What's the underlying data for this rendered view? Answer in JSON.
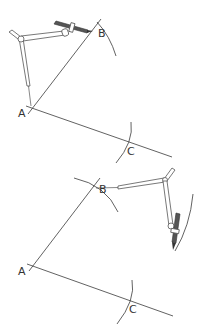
{
  "diagram": {
    "colors": {
      "line": "#3a3a3a",
      "pencil": "#555555",
      "background": "#ffffff"
    },
    "panels": [
      {
        "id": "step-1",
        "points": {
          "A": "A",
          "B": "B",
          "C": "C"
        },
        "labels": {
          "a": "A",
          "b": "B",
          "c": "C"
        }
      },
      {
        "id": "step-2",
        "points": {
          "A": "A",
          "B": "B",
          "C": "C"
        },
        "labels": {
          "a": "A",
          "b": "B",
          "c": "C"
        }
      }
    ]
  }
}
